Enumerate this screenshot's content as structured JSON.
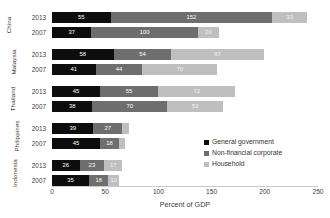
{
  "chart_data": {
    "type": "bar",
    "orientation": "horizontal",
    "stacked": true,
    "title": "",
    "subtitle": "",
    "xlabel": "Percent of GDP",
    "ylabel": "",
    "xlim": [
      0,
      250
    ],
    "xticks": [
      0,
      50,
      100,
      150,
      200,
      250
    ],
    "xtick_labels": [
      "0",
      "50",
      "100",
      "150",
      "200",
      "250"
    ],
    "grid": false,
    "legend_position": "center-right",
    "series": [
      {
        "name": "General government",
        "color": "#0d0d0d",
        "values": [
          55,
          37,
          58,
          41,
          45,
          38,
          39,
          45,
          26,
          35
        ]
      },
      {
        "name": "Non-financial corporate",
        "color": "#6e6e6e",
        "values": [
          152,
          100,
          54,
          44,
          55,
          70,
          27,
          18,
          23,
          18
        ]
      },
      {
        "name": "Household",
        "color": "#bfbfbf",
        "values": [
          33,
          20,
          87,
          70,
          72,
          53,
          6,
          6,
          17,
          10
        ]
      }
    ],
    "categories": [
      "China 2013",
      "China 2007",
      "Malaysia 2013",
      "Malaysia 2007",
      "Thailand 2013",
      "Thailand 2007",
      "Philippines 2013",
      "Philippines 2007",
      "Indonesia 2013",
      "Indonesia 2007"
    ],
    "groups": [
      {
        "country": "China",
        "rows": [
          {
            "year": "2013",
            "government": 55,
            "corporate": 152,
            "household": 33,
            "total": 240,
            "government_label": "55",
            "corporate_label": "152",
            "household_label": "33"
          },
          {
            "year": "2007",
            "government": 37,
            "corporate": 100,
            "household": 20,
            "total": 157,
            "government_label": "37",
            "corporate_label": "100",
            "household_label": "20"
          }
        ]
      },
      {
        "country": "Malaysia",
        "rows": [
          {
            "year": "2013",
            "government": 58,
            "corporate": 54,
            "household": 87,
            "total": 199,
            "government_label": "58",
            "corporate_label": "54",
            "household_label": "87"
          },
          {
            "year": "2007",
            "government": 41,
            "corporate": 44,
            "household": 70,
            "total": 155,
            "government_label": "41",
            "corporate_label": "44",
            "household_label": "70"
          }
        ]
      },
      {
        "country": "Thailand",
        "rows": [
          {
            "year": "2013",
            "government": 45,
            "corporate": 55,
            "household": 72,
            "total": 172,
            "government_label": "45",
            "corporate_label": "55",
            "household_label": "72"
          },
          {
            "year": "2007",
            "government": 38,
            "corporate": 70,
            "household": 53,
            "total": 161,
            "government_label": "38",
            "corporate_label": "70",
            "household_label": "53"
          }
        ]
      },
      {
        "country": "Philippines",
        "rows": [
          {
            "year": "2013",
            "government": 39,
            "corporate": 27,
            "household": 6,
            "total": 72,
            "government_label": "39",
            "corporate_label": "27",
            "household_label": "6"
          },
          {
            "year": "2007",
            "government": 45,
            "corporate": 18,
            "household": 6,
            "total": 69,
            "government_label": "45",
            "corporate_label": "18",
            "household_label": "6"
          }
        ]
      },
      {
        "country": "Indonesia",
        "rows": [
          {
            "year": "2013",
            "government": 26,
            "corporate": 23,
            "household": 17,
            "total": 66,
            "government_label": "26",
            "corporate_label": "23",
            "household_label": "17"
          },
          {
            "year": "2007",
            "government": 35,
            "corporate": 18,
            "household": 10,
            "total": 63,
            "government_label": "35",
            "corporate_label": "18",
            "household_label": "10"
          }
        ]
      }
    ],
    "legend": [
      {
        "label": "General government",
        "color": "#0d0d0d"
      },
      {
        "label": "Non-financial corporate",
        "color": "#6e6e6e"
      },
      {
        "label": "Household",
        "color": "#bfbfbf"
      }
    ]
  },
  "colors": {
    "government": "#0d0d0d",
    "corporate": "#6e6e6e",
    "household": "#bfbfbf",
    "axis": "#c9c9c9",
    "text": "#333333",
    "background": "#ffffff"
  }
}
